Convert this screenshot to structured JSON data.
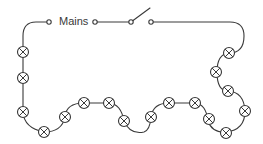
{
  "diagram": {
    "mains_label": "Mains",
    "switch_state": "open",
    "lamp_symbol": "circle-with-cross",
    "lamp_count": 20,
    "colors": {
      "wire": "#3a3a3a",
      "background": "#ffffff"
    }
  }
}
